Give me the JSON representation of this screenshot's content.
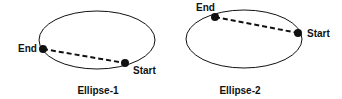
{
  "diagrams": [
    {
      "caption": "Ellipse-1",
      "start_label": "Start",
      "end_label": "End"
    },
    {
      "caption": "Ellipse-2",
      "start_label": "Start",
      "end_label": "End"
    }
  ],
  "colors": {
    "stroke": "#111111",
    "background": "#ffffff"
  }
}
